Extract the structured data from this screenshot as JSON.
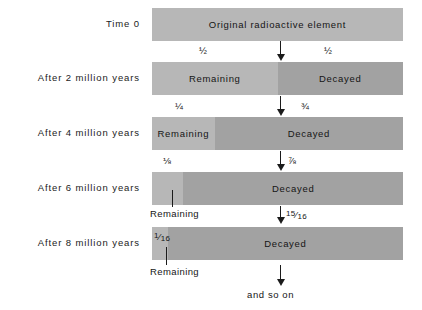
{
  "diagram": {
    "colors": {
      "remaining": "#b7b7b7",
      "decayed": "#a2a2a2",
      "text": "#151515",
      "background": "#ffffff"
    },
    "rows": [
      {
        "time_label": "Time 0",
        "remaining_fraction_text": "",
        "decayed_fraction_text": "",
        "bar_text": "Original radioactive element",
        "remaining_label": "",
        "decayed_label": "",
        "remaining_pct": 100
      },
      {
        "time_label": "After 2 million years",
        "remaining_fraction_text": "½",
        "decayed_fraction_text": "½",
        "bar_text": "",
        "remaining_label": "Remaining",
        "decayed_label": "Decayed",
        "remaining_pct": 50
      },
      {
        "time_label": "After 4 million years",
        "remaining_fraction_text": "¼",
        "decayed_fraction_text": "¾",
        "bar_text": "",
        "remaining_label": "Remaining",
        "decayed_label": "Decayed",
        "remaining_pct": 25
      },
      {
        "time_label": "After 6 million years",
        "remaining_fraction_text": "⅛",
        "decayed_fraction_text": "⅞",
        "bar_text": "",
        "remaining_label": "Remaining",
        "decayed_label": "Decayed",
        "remaining_pct": 12.5
      },
      {
        "time_label": "After 8 million years",
        "remaining_fraction_text": "1/16",
        "decayed_fraction_text": "15/16",
        "bar_text": "",
        "remaining_label": "Remaining",
        "decayed_label": "Decayed",
        "remaining_pct": 6.25
      }
    ],
    "fraction_parts": {
      "row5_remaining": {
        "numerator": "1",
        "denominator": "16"
      },
      "row5_decayed": {
        "numerator": "15",
        "denominator": "16"
      }
    },
    "footer_label": "and so on"
  }
}
